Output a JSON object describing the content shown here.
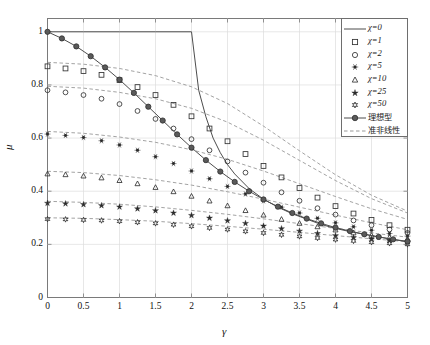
{
  "chart_data": {
    "type": "line",
    "title": "",
    "xlabel": "γ",
    "ylabel": "μ",
    "xlim": [
      0,
      5
    ],
    "ylim": [
      0,
      1.05
    ],
    "xticks": [
      "0",
      "0.5",
      "1",
      "1.5",
      "2",
      "2.5",
      "3",
      "3.5",
      "4",
      "4.5",
      "5"
    ],
    "yticks": [
      "0",
      "0.2",
      "0.4",
      "0.6",
      "0.8",
      "1"
    ],
    "grid": true,
    "legend_position": "top-right",
    "series": [
      {
        "name": "χ=0",
        "style": "solid-line",
        "marker": "none",
        "x": [
          0,
          0.5,
          1,
          1.5,
          2,
          2.1,
          2.2,
          2.3,
          2.4,
          2.5,
          2.6,
          2.8,
          3,
          3.2,
          3.4,
          3.6,
          3.8,
          4,
          4.2,
          4.4,
          4.6,
          4.8,
          5
        ],
        "y": [
          1,
          1,
          1,
          1,
          1,
          0.78,
          0.68,
          0.6,
          0.545,
          0.5,
          0.465,
          0.41,
          0.37,
          0.34,
          0.315,
          0.295,
          0.275,
          0.26,
          0.248,
          0.238,
          0.228,
          0.218,
          0.21
        ]
      },
      {
        "name": "χ=1",
        "style": "markers",
        "marker": "square-open",
        "x": [
          0,
          0.25,
          0.5,
          0.75,
          1,
          1.25,
          1.5,
          1.75,
          2,
          2.25,
          2.5,
          2.75,
          3,
          3.25,
          3.5,
          3.75,
          4,
          4.25,
          4.5,
          4.75,
          5
        ],
        "y": [
          0.87,
          0.862,
          0.852,
          0.838,
          0.818,
          0.792,
          0.762,
          0.725,
          0.682,
          0.636,
          0.588,
          0.54,
          0.495,
          0.452,
          0.412,
          0.376,
          0.344,
          0.316,
          0.292,
          0.272,
          0.255
        ]
      },
      {
        "name": "χ=2",
        "style": "markers",
        "marker": "circle-open",
        "x": [
          0,
          0.25,
          0.5,
          0.75,
          1,
          1.25,
          1.5,
          1.75,
          2,
          2.25,
          2.5,
          2.75,
          3,
          3.25,
          3.5,
          3.75,
          4,
          4.25,
          4.5,
          4.75,
          5
        ],
        "y": [
          0.78,
          0.772,
          0.762,
          0.748,
          0.728,
          0.702,
          0.672,
          0.636,
          0.596,
          0.554,
          0.512,
          0.47,
          0.432,
          0.396,
          0.364,
          0.336,
          0.312,
          0.29,
          0.272,
          0.256,
          0.243
        ]
      },
      {
        "name": "χ=5",
        "style": "markers",
        "marker": "asterisk-dot",
        "x": [
          0,
          0.25,
          0.5,
          0.75,
          1,
          1.25,
          1.5,
          1.75,
          2,
          2.25,
          2.5,
          2.75,
          3,
          3.25,
          3.5,
          3.75,
          4,
          4.25,
          4.5,
          4.75,
          5
        ],
        "y": [
          0.615,
          0.61,
          0.602,
          0.59,
          0.574,
          0.554,
          0.53,
          0.504,
          0.476,
          0.447,
          0.418,
          0.39,
          0.364,
          0.34,
          0.318,
          0.298,
          0.281,
          0.266,
          0.253,
          0.241,
          0.231
        ]
      },
      {
        "name": "χ=10",
        "style": "markers",
        "marker": "triangle-open",
        "x": [
          0,
          0.25,
          0.5,
          0.75,
          1,
          1.25,
          1.5,
          1.75,
          2,
          2.25,
          2.5,
          2.75,
          3,
          3.25,
          3.5,
          3.75,
          4,
          4.25,
          4.5,
          4.75,
          5
        ],
        "y": [
          0.465,
          0.462,
          0.457,
          0.45,
          0.44,
          0.428,
          0.414,
          0.398,
          0.381,
          0.363,
          0.345,
          0.327,
          0.31,
          0.294,
          0.279,
          0.266,
          0.254,
          0.243,
          0.234,
          0.226,
          0.219
        ]
      },
      {
        "name": "χ=25",
        "style": "markers",
        "marker": "star",
        "x": [
          0,
          0.25,
          0.5,
          0.75,
          1,
          1.25,
          1.5,
          1.75,
          2,
          2.25,
          2.5,
          2.75,
          3,
          3.25,
          3.5,
          3.75,
          4,
          4.25,
          4.5,
          4.75,
          5
        ],
        "y": [
          0.355,
          0.353,
          0.35,
          0.346,
          0.341,
          0.334,
          0.327,
          0.318,
          0.309,
          0.299,
          0.289,
          0.279,
          0.269,
          0.259,
          0.25,
          0.241,
          0.233,
          0.226,
          0.22,
          0.214,
          0.209
        ]
      },
      {
        "name": "χ=50",
        "style": "markers",
        "marker": "hexagram-open",
        "x": [
          0,
          0.25,
          0.5,
          0.75,
          1,
          1.25,
          1.5,
          1.75,
          2,
          2.25,
          2.5,
          2.75,
          3,
          3.25,
          3.5,
          3.75,
          4,
          4.25,
          4.5,
          4.75,
          5
        ],
        "y": [
          0.295,
          0.294,
          0.292,
          0.29,
          0.287,
          0.283,
          0.279,
          0.274,
          0.268,
          0.262,
          0.256,
          0.249,
          0.243,
          0.236,
          0.23,
          0.224,
          0.218,
          0.213,
          0.208,
          0.204,
          0.2
        ]
      },
      {
        "name": "理想型",
        "style": "line-markers",
        "marker": "circle-filled",
        "x": [
          0,
          0.2,
          0.4,
          0.6,
          0.8,
          1,
          1.2,
          1.4,
          1.6,
          1.8,
          2,
          2.2,
          2.4,
          2.6,
          2.8,
          3,
          3.2,
          3.4,
          3.6,
          3.8,
          4,
          4.2,
          4.4,
          4.6,
          4.8,
          5
        ],
        "y": [
          1.0,
          0.975,
          0.945,
          0.908,
          0.866,
          0.82,
          0.77,
          0.718,
          0.666,
          0.614,
          0.564,
          0.517,
          0.474,
          0.435,
          0.4,
          0.369,
          0.342,
          0.318,
          0.297,
          0.279,
          0.263,
          0.25,
          0.238,
          0.228,
          0.219,
          0.211
        ]
      },
      {
        "name": "准非线性",
        "style": "dashed",
        "marker": "none",
        "note": "dashed companion curves, one per χ level"
      }
    ],
    "dashed_curves": [
      {
        "for": "χ=1",
        "x": [
          0,
          0.5,
          1,
          1.5,
          2,
          2.5,
          3,
          3.5,
          4,
          4.5,
          5
        ],
        "y": [
          0.885,
          0.878,
          0.862,
          0.835,
          0.793,
          0.73,
          0.645,
          0.552,
          0.462,
          0.385,
          0.325
        ]
      },
      {
        "for": "χ=2",
        "x": [
          0,
          0.5,
          1,
          1.5,
          2,
          2.5,
          3,
          3.5,
          4,
          4.5,
          5
        ],
        "y": [
          0.795,
          0.788,
          0.772,
          0.748,
          0.712,
          0.66,
          0.592,
          0.516,
          0.44,
          0.372,
          0.318
        ]
      },
      {
        "for": "χ=5",
        "x": [
          0,
          0.5,
          1,
          1.5,
          2,
          2.5,
          3,
          3.5,
          4,
          4.5,
          5
        ],
        "y": [
          0.625,
          0.618,
          0.604,
          0.584,
          0.556,
          0.52,
          0.476,
          0.428,
          0.38,
          0.334,
          0.294
        ]
      },
      {
        "for": "χ=10",
        "x": [
          0,
          0.5,
          1,
          1.5,
          2,
          2.5,
          3,
          3.5,
          4,
          4.5,
          5
        ],
        "y": [
          0.475,
          0.47,
          0.459,
          0.443,
          0.423,
          0.398,
          0.37,
          0.34,
          0.31,
          0.281,
          0.255
        ]
      },
      {
        "for": "χ=25",
        "x": [
          0,
          0.5,
          1,
          1.5,
          2,
          2.5,
          3,
          3.5,
          4,
          4.5,
          5
        ],
        "y": [
          0.362,
          0.358,
          0.351,
          0.341,
          0.328,
          0.313,
          0.296,
          0.278,
          0.26,
          0.243,
          0.227
        ]
      },
      {
        "for": "χ=50",
        "x": [
          0,
          0.5,
          1,
          1.5,
          2,
          2.5,
          3,
          3.5,
          4,
          4.5,
          5
        ],
        "y": [
          0.3,
          0.298,
          0.293,
          0.287,
          0.278,
          0.268,
          0.257,
          0.245,
          0.233,
          0.221,
          0.21
        ]
      }
    ],
    "colors": {
      "line": "#4d4d4d",
      "marker": "#333333",
      "dashed": "#8c8c8c",
      "grid": "#dcdcdc",
      "axis": "#7a7a7a"
    }
  },
  "legend": {
    "entries": [
      {
        "label": "χ=0",
        "marker": "solid-line",
        "cjk": false
      },
      {
        "label": "χ=1",
        "marker": "square-open",
        "cjk": false
      },
      {
        "label": "χ=2",
        "marker": "circle-open",
        "cjk": false
      },
      {
        "label": "χ=5",
        "marker": "asterisk-dot",
        "cjk": false
      },
      {
        "label": "χ=10",
        "marker": "triangle-open",
        "cjk": false
      },
      {
        "label": "χ=25",
        "marker": "star",
        "cjk": false
      },
      {
        "label": "χ=50",
        "marker": "hexagram-open",
        "cjk": false
      },
      {
        "label": "理想型",
        "marker": "line-circle-filled",
        "cjk": true
      },
      {
        "label": "准非线性",
        "marker": "dashed-line",
        "cjk": true
      }
    ]
  }
}
